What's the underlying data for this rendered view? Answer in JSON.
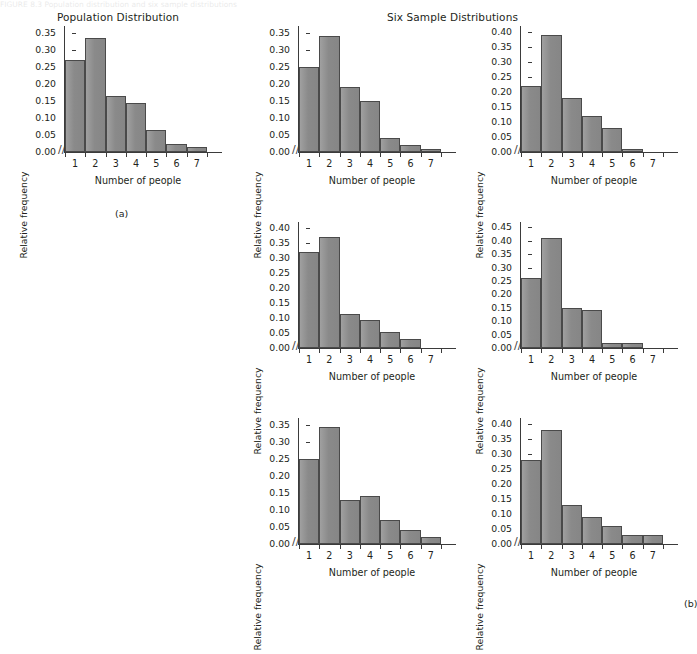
{
  "figure": {
    "caption_strip": "FIGURE 8.3   Population distribution and six sample distributions",
    "title_population": "Population Distribution",
    "title_samples": "Six Sample Distributions",
    "label_a": "(a)",
    "label_b": "(b)",
    "axis_break_glyph": "//",
    "bar_color": "#8e8e8e",
    "bar_border_color": "#4a4a4a",
    "axis_color": "#3b3b3b"
  },
  "chart_data": [
    {
      "id": "population",
      "type": "bar",
      "title": "Population Distribution",
      "xlabel": "Number of people",
      "ylabel": "Relative frequency",
      "categories": [
        "1",
        "2",
        "3",
        "4",
        "5",
        "6",
        "7"
      ],
      "values": [
        0.27,
        0.335,
        0.165,
        0.143,
        0.065,
        0.025,
        0.015
      ],
      "ylim": [
        0.0,
        0.37
      ],
      "yticks": [
        "0.00",
        "0.05",
        "0.10",
        "0.15",
        "0.20",
        "0.25",
        "0.30",
        "0.35"
      ],
      "ytick_values": [
        0.0,
        0.05,
        0.1,
        0.15,
        0.2,
        0.25,
        0.3,
        0.35
      ],
      "grid": false,
      "legend": "none"
    },
    {
      "id": "sample-1",
      "type": "bar",
      "title": "",
      "xlabel": "Number of people",
      "ylabel": "Relative frequency",
      "categories": [
        "1",
        "2",
        "3",
        "4",
        "5",
        "6",
        "7"
      ],
      "values": [
        0.25,
        0.34,
        0.19,
        0.15,
        0.04,
        0.02,
        0.01
      ],
      "ylim": [
        0.0,
        0.37
      ],
      "yticks": [
        "0.00",
        "0.05",
        "0.10",
        "0.15",
        "0.20",
        "0.25",
        "0.30",
        "0.35"
      ],
      "ytick_values": [
        0.0,
        0.05,
        0.1,
        0.15,
        0.2,
        0.25,
        0.3,
        0.35
      ],
      "grid": false,
      "legend": "none"
    },
    {
      "id": "sample-2",
      "type": "bar",
      "title": "",
      "xlabel": "Number of people",
      "ylabel": "Relative frequency",
      "categories": [
        "1",
        "2",
        "3",
        "4",
        "5",
        "6",
        "7"
      ],
      "values": [
        0.22,
        0.39,
        0.18,
        0.12,
        0.08,
        0.01,
        0.0
      ],
      "ylim": [
        0.0,
        0.42
      ],
      "yticks": [
        "0.00",
        "0.05",
        "0.10",
        "0.15",
        "0.20",
        "0.25",
        "0.30",
        "0.35",
        "0.40"
      ],
      "ytick_values": [
        0.0,
        0.05,
        0.1,
        0.15,
        0.2,
        0.25,
        0.3,
        0.35,
        0.4
      ],
      "grid": false,
      "legend": "none"
    },
    {
      "id": "sample-3",
      "type": "bar",
      "title": "",
      "xlabel": "Number of people",
      "ylabel": "Relative frequency",
      "categories": [
        "1",
        "2",
        "3",
        "4",
        "5",
        "6",
        "7"
      ],
      "values": [
        0.32,
        0.37,
        0.115,
        0.095,
        0.055,
        0.03,
        0.0
      ],
      "ylim": [
        0.0,
        0.42
      ],
      "yticks": [
        "0.00",
        "0.05",
        "0.10",
        "0.15",
        "0.20",
        "0.25",
        "0.30",
        "0.35",
        "0.40"
      ],
      "ytick_values": [
        0.0,
        0.05,
        0.1,
        0.15,
        0.2,
        0.25,
        0.3,
        0.35,
        0.4
      ],
      "grid": false,
      "legend": "none"
    },
    {
      "id": "sample-4",
      "type": "bar",
      "title": "",
      "xlabel": "Number of people",
      "ylabel": "Relative frequency",
      "categories": [
        "1",
        "2",
        "3",
        "4",
        "5",
        "6",
        "7"
      ],
      "values": [
        0.26,
        0.41,
        0.15,
        0.14,
        0.02,
        0.02,
        0.0
      ],
      "ylim": [
        0.0,
        0.47
      ],
      "yticks": [
        "0.00",
        "0.05",
        "0.10",
        "0.15",
        "0.20",
        "0.25",
        "0.30",
        "0.35",
        "0.40",
        "0.45"
      ],
      "ytick_values": [
        0.0,
        0.05,
        0.1,
        0.15,
        0.2,
        0.25,
        0.3,
        0.35,
        0.4,
        0.45
      ],
      "grid": false,
      "legend": "none"
    },
    {
      "id": "sample-5",
      "type": "bar",
      "title": "",
      "xlabel": "Number of people",
      "ylabel": "Relative frequency",
      "categories": [
        "1",
        "2",
        "3",
        "4",
        "5",
        "6",
        "7"
      ],
      "values": [
        0.25,
        0.345,
        0.13,
        0.14,
        0.07,
        0.04,
        0.02
      ],
      "ylim": [
        0.0,
        0.37
      ],
      "yticks": [
        "0.00",
        "0.05",
        "0.10",
        "0.15",
        "0.20",
        "0.25",
        "0.30",
        "0.35"
      ],
      "ytick_values": [
        0.0,
        0.05,
        0.1,
        0.15,
        0.2,
        0.25,
        0.3,
        0.35
      ],
      "grid": false,
      "legend": "none"
    },
    {
      "id": "sample-6",
      "type": "bar",
      "title": "",
      "xlabel": "Number of people",
      "ylabel": "Relative frequency",
      "categories": [
        "1",
        "2",
        "3",
        "4",
        "5",
        "6",
        "7"
      ],
      "values": [
        0.28,
        0.38,
        0.13,
        0.09,
        0.06,
        0.03,
        0.03
      ],
      "ylim": [
        0.0,
        0.42
      ],
      "yticks": [
        "0.00",
        "0.05",
        "0.10",
        "0.15",
        "0.20",
        "0.25",
        "0.30",
        "0.35",
        "0.40"
      ],
      "ytick_values": [
        0.0,
        0.05,
        0.1,
        0.15,
        0.2,
        0.25,
        0.3,
        0.35,
        0.4
      ],
      "grid": false,
      "legend": "none"
    }
  ],
  "layout": [
    {
      "chart_index": 0,
      "left": 18,
      "top": 26,
      "plot_width": 148
    },
    {
      "chart_index": 1,
      "left": 252,
      "top": 26,
      "plot_width": 148
    },
    {
      "chart_index": 2,
      "left": 474,
      "top": 26,
      "plot_width": 148
    },
    {
      "chart_index": 3,
      "left": 252,
      "top": 222,
      "plot_width": 148
    },
    {
      "chart_index": 4,
      "left": 474,
      "top": 222,
      "plot_width": 148
    },
    {
      "chart_index": 5,
      "left": 252,
      "top": 418,
      "plot_width": 148
    },
    {
      "chart_index": 6,
      "left": 474,
      "top": 418,
      "plot_width": 148
    }
  ]
}
